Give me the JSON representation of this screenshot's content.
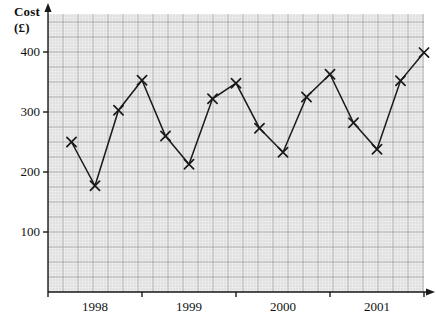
{
  "chart_data": {
    "type": "line",
    "title": "Cost (£)",
    "ylabel": "Cost (£)",
    "xlabel": "",
    "ytick_labels": [
      "400",
      "300",
      "200",
      "100"
    ],
    "ytick_values": [
      400,
      300,
      200,
      100
    ],
    "ylim": [
      0,
      440
    ],
    "xtick_labels": [
      "1998",
      "1999",
      "2000",
      "2001"
    ],
    "xlim": [
      0,
      17
    ],
    "grid": true,
    "grid_style": "graph-paper",
    "legend": "none",
    "marker": "x-cross",
    "categories": [
      "1997 Q4",
      "1998 Q1",
      "1998 Q2",
      "1998 Q3",
      "1998 Q4",
      "1999 Q1",
      "1999 Q2",
      "1999 Q3",
      "1999 Q4",
      "2000 Q1",
      "2000 Q2",
      "2000 Q3",
      "2000 Q4",
      "2001 Q1",
      "2001 Q2",
      "2001 Q3"
    ],
    "values": [
      250,
      177,
      303,
      353,
      260,
      213,
      322,
      348,
      273,
      233,
      325,
      363,
      282,
      238,
      352,
      399
    ],
    "x": [
      1,
      2,
      3,
      4,
      5,
      6,
      7,
      8,
      9,
      10,
      11,
      12,
      13,
      14,
      15,
      16
    ],
    "series": [
      {
        "name": "Cost",
        "values": [
          250,
          177,
          303,
          353,
          260,
          213,
          322,
          348,
          273,
          233,
          325,
          363,
          282,
          238,
          352,
          399
        ]
      }
    ],
    "colors": {
      "line": "#1a1a1a",
      "marker": "#1a1a1a",
      "grid_minor": "#c9c9c9",
      "grid_major": "#9a9a9a",
      "plot_background": "#f1f1f1",
      "axis": "#1a1a1a"
    }
  },
  "geometry": {
    "origin_x": 48,
    "origin_y": 292,
    "plot_right": 424,
    "plot_top": 14,
    "units_per_px_y": 0.6,
    "x_ticks_px": [
      142,
      236,
      330,
      424
    ],
    "year_label_centers_px": [
      95,
      189,
      283,
      377
    ]
  }
}
